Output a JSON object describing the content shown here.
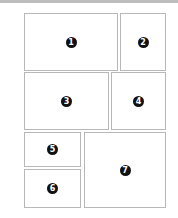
{
  "diagram": {
    "type": "panel-layout",
    "colors": {
      "border": "#b8b8b8",
      "marker": "#111111",
      "marker_text": "#ffffff",
      "top_rule": "#bdbdbd"
    },
    "panels": [
      {
        "id": 1,
        "label": "1",
        "x": 24,
        "y": 13,
        "w": 94,
        "h": 58
      },
      {
        "id": 2,
        "label": "2",
        "x": 120,
        "y": 13,
        "w": 46,
        "h": 58
      },
      {
        "id": 3,
        "label": "3",
        "x": 24,
        "y": 72,
        "w": 85,
        "h": 58
      },
      {
        "id": 4,
        "label": "4",
        "x": 111,
        "y": 72,
        "w": 55,
        "h": 58
      },
      {
        "id": 5,
        "label": "5",
        "x": 24,
        "y": 132,
        "w": 57,
        "h": 35
      },
      {
        "id": 6,
        "label": "6",
        "x": 24,
        "y": 169,
        "w": 57,
        "h": 39
      },
      {
        "id": 7,
        "label": "7",
        "x": 84,
        "y": 132,
        "w": 82,
        "h": 76
      }
    ]
  }
}
